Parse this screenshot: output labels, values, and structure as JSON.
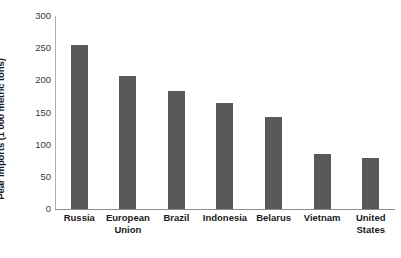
{
  "chart_data": {
    "type": "bar",
    "title": "",
    "xlabel": "",
    "ylabel": "Pear imports (1 000 metric tons)",
    "categories": [
      "Russia",
      "European Union",
      "Brazil",
      "Indonesia",
      "Belarus",
      "Vietnam",
      "United States"
    ],
    "values": [
      255,
      207,
      184,
      165,
      143,
      85,
      79
    ],
    "ylim": [
      0,
      300
    ],
    "yticks": [
      0,
      50,
      100,
      150,
      200,
      250,
      300
    ],
    "ytick_labels": [
      "0",
      "50",
      "100",
      "150",
      "200",
      "250",
      "300"
    ],
    "grid": false,
    "legend": "none",
    "bar_color": "#595959",
    "axis_color": "#8c8c8c",
    "text_color": "#1a1a1a"
  },
  "axis": {
    "y_title": "Pear imports (1 000 metric tons)"
  },
  "category_lines": [
    [
      "Russia"
    ],
    [
      "European",
      "Union"
    ],
    [
      "Brazil"
    ],
    [
      "Indonesia"
    ],
    [
      "Belarus"
    ],
    [
      "Vietnam"
    ],
    [
      "United",
      "States"
    ]
  ]
}
